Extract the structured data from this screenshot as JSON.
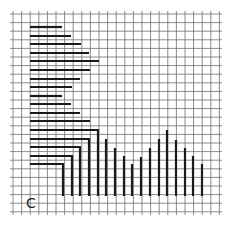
{
  "panel": {
    "label": "C"
  },
  "colors": {
    "background": "#ffffff",
    "grid": "#6e6e6e",
    "bars": "#1a1a1a",
    "label": "#222222"
  },
  "grid": {
    "x0": 13,
    "x1": 219,
    "y0": 14,
    "y1": 212,
    "step": 8.6,
    "overhang": 3
  },
  "horizontal_bars": [
    {
      "y": 27,
      "x_start": 30,
      "x_end": 62
    },
    {
      "y": 36,
      "x_start": 30,
      "x_end": 71
    },
    {
      "y": 44,
      "x_start": 30,
      "x_end": 81
    },
    {
      "y": 53,
      "x_start": 30,
      "x_end": 89
    },
    {
      "y": 61,
      "x_start": 30,
      "x_end": 99
    },
    {
      "y": 70,
      "x_start": 30,
      "x_end": 90
    },
    {
      "y": 79,
      "x_start": 30,
      "x_end": 80
    },
    {
      "y": 87,
      "x_start": 30,
      "x_end": 72
    },
    {
      "y": 96,
      "x_start": 30,
      "x_end": 62
    },
    {
      "y": 104,
      "x_start": 30,
      "x_end": 71
    },
    {
      "y": 113,
      "x_start": 30,
      "x_end": 80
    },
    {
      "y": 121,
      "x_start": 30,
      "x_end": 90
    }
  ],
  "l_bars": [
    {
      "y": 130,
      "x_start": 30,
      "x_corner": 98,
      "y_bottom": 196
    },
    {
      "y": 139,
      "x_start": 30,
      "x_corner": 89,
      "y_bottom": 196
    },
    {
      "y": 147,
      "x_start": 30,
      "x_corner": 80,
      "y_bottom": 196
    },
    {
      "y": 156,
      "x_start": 30,
      "x_corner": 72,
      "y_bottom": 196
    },
    {
      "y": 164,
      "x_start": 30,
      "x_corner": 63,
      "y_bottom": 196
    }
  ],
  "vertical_bars": [
    {
      "x": 106,
      "y_top": 139,
      "y_bottom": 196
    },
    {
      "x": 115,
      "y_top": 148,
      "y_bottom": 196
    },
    {
      "x": 124,
      "y_top": 156,
      "y_bottom": 196
    },
    {
      "x": 132,
      "y_top": 164,
      "y_bottom": 196
    },
    {
      "x": 141,
      "y_top": 157,
      "y_bottom": 196
    },
    {
      "x": 150,
      "y_top": 148,
      "y_bottom": 196
    },
    {
      "x": 159,
      "y_top": 139,
      "y_bottom": 196
    },
    {
      "x": 167,
      "y_top": 130,
      "y_bottom": 196
    },
    {
      "x": 176,
      "y_top": 140,
      "y_bottom": 196
    },
    {
      "x": 185,
      "y_top": 148,
      "y_bottom": 196
    },
    {
      "x": 193,
      "y_top": 156,
      "y_bottom": 196
    },
    {
      "x": 202,
      "y_top": 164,
      "y_bottom": 196
    }
  ]
}
